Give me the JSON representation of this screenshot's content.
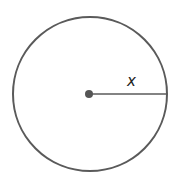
{
  "diagram": {
    "type": "circle-with-radius",
    "radius_label": "x",
    "colors": {
      "stroke": "#5a5a5a",
      "center_dot": "#555555",
      "background": "#ffffff",
      "label": "#222222"
    },
    "circle": {
      "cx": 90,
      "cy": 94,
      "r": 77
    },
    "radius_line": {
      "x1": 90,
      "y1": 94,
      "x2": 167,
      "y2": 94
    },
    "label_position": {
      "x": 131,
      "y": 85
    }
  }
}
